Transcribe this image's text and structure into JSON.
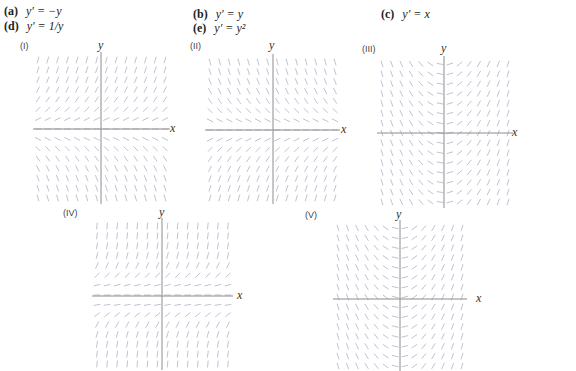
{
  "equations": [
    {
      "id": "a",
      "label": "(a)",
      "expr": "y′ = −y",
      "x": 4,
      "y": 5
    },
    {
      "id": "b",
      "label": "(b)",
      "expr": "y′ = y",
      "x": 193,
      "y": 8
    },
    {
      "id": "c",
      "label": "(c)",
      "expr": "y′ = x",
      "x": 381,
      "y": 8
    },
    {
      "id": "d",
      "label": "(d)",
      "expr": "y′ = 1/y",
      "x": 4,
      "y": 20
    },
    {
      "id": "e",
      "label": "(e)",
      "expr": "y′ = y²",
      "x": 193,
      "y": 22
    }
  ],
  "panels": [
    {
      "tag": "(I)",
      "slope": "y",
      "tagX": 20,
      "tagY": 43,
      "ox": 101,
      "oy": 129,
      "x0": 38,
      "x1": 165,
      "y0": 60,
      "y1": 198,
      "xLabelX": 170,
      "yLabelX": 98,
      "yLabelY": 41,
      "cols": 14,
      "rows": 15
    },
    {
      "tag": "(II)",
      "slope": "-y",
      "tagX": 190,
      "tagY": 43,
      "ox": 273,
      "oy": 130,
      "x0": 210,
      "x1": 335,
      "y0": 62,
      "y1": 198,
      "xLabelX": 341,
      "yLabelX": 269,
      "yLabelY": 41,
      "cols": 14,
      "rows": 15
    },
    {
      "tag": "(III)",
      "slope": "x",
      "tagX": 362,
      "tagY": 47,
      "ox": 444,
      "oy": 133,
      "x0": 382,
      "x1": 508,
      "y0": 64,
      "y1": 202,
      "xLabelX": 512,
      "yLabelX": 441,
      "yLabelY": 43,
      "cols": 14,
      "rows": 15
    },
    {
      "tag": "(IV)",
      "slope": "y2",
      "tagX": 63,
      "tagY": 211,
      "ox": 162,
      "oy": 296,
      "x0": 97,
      "x1": 228,
      "y0": 226,
      "y1": 364,
      "xLabelX": 237,
      "yLabelX": 159,
      "yLabelY": 209,
      "cols": 14,
      "rows": 15
    },
    {
      "tag": "(V)",
      "slope": "1/y-like",
      "tagX": 305,
      "tagY": 213,
      "ox": 400,
      "oy": 299,
      "x0": 338,
      "x1": 462,
      "y0": 228,
      "y1": 366,
      "xLabelX": 476,
      "yLabelX": 396,
      "yLabelY": 211,
      "cols": 14,
      "rows": 15
    }
  ],
  "axis_labels": {
    "x": "x",
    "y": "y"
  },
  "colors": {
    "segment": "#aeb3c8",
    "axis": "#8c8c8c",
    "text": "#222222"
  }
}
